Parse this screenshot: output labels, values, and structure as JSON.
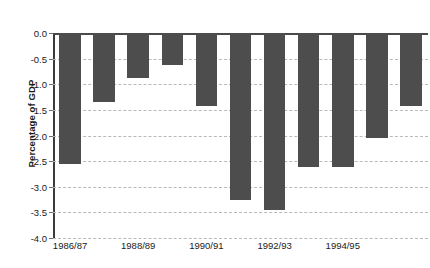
{
  "chart_data": {
    "type": "bar",
    "title": "",
    "xlabel": "",
    "ylabel": "Percentage of GDP",
    "ylim": [
      -4.0,
      0.0
    ],
    "grid": true,
    "legend": "none",
    "orientation": "vertical",
    "bar_color": "#4d4d4d",
    "categories": [
      "1986/87",
      "1987/88",
      "1988/89",
      "1989/90",
      "1990/91",
      "1991/92",
      "1992/93",
      "1993/94",
      "1994/95",
      "1995/96",
      "1996/97"
    ],
    "visible_tick_labels": [
      "1986/87",
      "1988/89",
      "1990/91",
      "1992/93",
      "1994/95"
    ],
    "values": [
      -2.55,
      -1.35,
      -0.87,
      -0.62,
      -1.43,
      -3.25,
      -3.45,
      -2.62,
      -2.62,
      -2.05,
      -1.43
    ],
    "ytick_labels": [
      "0.0",
      "-0.5",
      "-1.0",
      "-1.5",
      "-2.0",
      "-2.5",
      "-3.0",
      "-3.5",
      "-4.0"
    ],
    "ytick_values": [
      0.0,
      -0.5,
      -1.0,
      -1.5,
      -2.0,
      -2.5,
      -3.0,
      -3.5,
      -4.0
    ]
  }
}
